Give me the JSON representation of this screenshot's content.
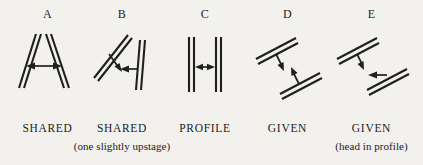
{
  "figure": {
    "type": "stage-body-position-diagram",
    "background_color": "#f2f1ee",
    "ink_color": "#1f1f1f",
    "panel_count": 5
  },
  "panels": [
    {
      "letter": "A",
      "caption": "SHARED",
      "subcaption": "",
      "description": "Two double-line actor bars angled toward each other forming an A shape, double-headed arrow between them"
    },
    {
      "letter": "B",
      "caption": "SHARED",
      "subcaption": "(one slightly upstage)",
      "description": "Left bar tilted with a stem, right bar near vertical, arrows pointing between them"
    },
    {
      "letter": "C",
      "caption": "PROFILE",
      "subcaption": "",
      "description": "Two parallel vertical double-line bars with a double-headed arrow between them"
    },
    {
      "letter": "D",
      "caption": "GIVEN",
      "subcaption": "",
      "description": "Two parallel diagonal bars each with a perpendicular stem arrow pointing toward the other"
    },
    {
      "letter": "E",
      "caption": "GIVEN",
      "subcaption": "(head in profile)",
      "description": "Two parallel diagonal bars, upper with perpendicular stem arrow, lower with horizontal arrow pointing left"
    }
  ]
}
